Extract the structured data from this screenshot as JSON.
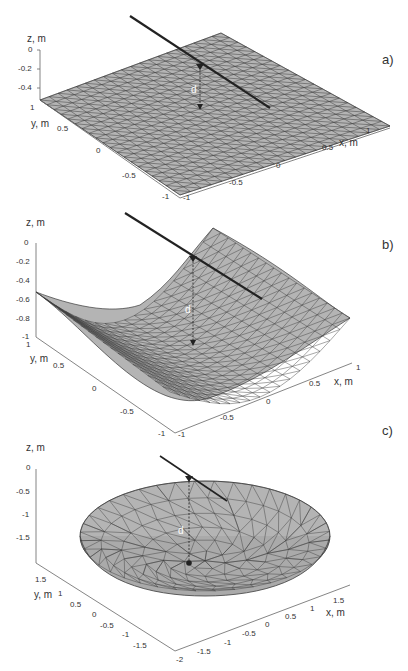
{
  "chart_data": [
    {
      "type": "surface",
      "panel_label": "a)",
      "title": "",
      "surface": "flat plane z = 0 (triangulated mesh)",
      "xlabel": "x, m",
      "ylabel": "y, m",
      "zlabel": "z, m",
      "xticks": [
        "-1",
        "-0.5",
        "0",
        "0.5",
        "1"
      ],
      "yticks": [
        "-1",
        "-0.5",
        "0",
        "0.5",
        "1"
      ],
      "zticks": [
        "0",
        "-0.2",
        "-0.4"
      ],
      "xlim": [
        -1,
        1
      ],
      "ylim": [
        -1,
        1
      ],
      "zlim": [
        -0.4,
        0
      ],
      "annotation": "d",
      "grid": false
    },
    {
      "type": "surface",
      "panel_label": "b)",
      "title": "",
      "surface": "parabolic cylinder (trough) triangulated mesh",
      "xlabel": "x, m",
      "ylabel": "y, m",
      "zlabel": "z, m",
      "xticks": [
        "-1",
        "-0.5",
        "0",
        "0.5",
        "1"
      ],
      "yticks": [
        "-1",
        "-0.5",
        "0",
        "0.5",
        "1"
      ],
      "zticks": [
        "0",
        "-0.2",
        "-0.4",
        "-0.6",
        "-0.8",
        "-1"
      ],
      "xlim": [
        -1,
        1
      ],
      "ylim": [
        -1,
        1
      ],
      "zlim": [
        -1,
        0
      ],
      "annotation": "d",
      "grid": false
    },
    {
      "type": "surface",
      "panel_label": "c)",
      "title": "",
      "surface": "paraboloid dish (irregular triangulated mesh)",
      "xlabel": "x, m",
      "ylabel": "y, m",
      "zlabel": "z, m",
      "xticks": [
        "-2",
        "-1.5",
        "-1",
        "-0.5",
        "0",
        "0.5",
        "1",
        "1.5"
      ],
      "yticks": [
        "-1.5",
        "-1",
        "-0.5",
        "0",
        "0.5",
        "1",
        "1.5"
      ],
      "zticks": [
        "0",
        "-0.5",
        "-1",
        "-1.5"
      ],
      "xlim": [
        -2,
        2
      ],
      "ylim": [
        -2,
        2
      ],
      "zlim": [
        -2,
        0
      ],
      "annotation": "d",
      "grid": false
    }
  ],
  "colors": {
    "surface_fill": "#b4b4b4",
    "mesh_edge": "#3c3c3c",
    "ray": "#222222",
    "axis": "#555555",
    "text": "#333333"
  }
}
